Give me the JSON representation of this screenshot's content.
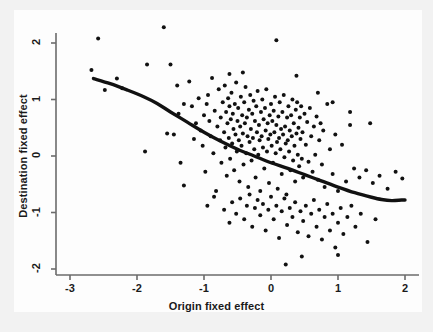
{
  "figure": {
    "background_color": "#f2f2f2",
    "panel_color": "#fdfdfd",
    "axis_color": "#6b6b6b",
    "point_color": "#111111",
    "curve_color": "#111111"
  },
  "chart_data": {
    "type": "scatter",
    "title": "",
    "xlabel": "Origin fixed effect",
    "ylabel": "Destination fixed effect",
    "xlim": [
      -3.05,
      2.1
    ],
    "ylim": [
      -2.15,
      2.35
    ],
    "xticks": [
      -3,
      -2,
      -1,
      0,
      1,
      2
    ],
    "xticklabels": [
      "-3",
      "-2",
      "-1",
      "0",
      "1",
      "2"
    ],
    "yticks": [
      -2,
      -1,
      0,
      1,
      2
    ],
    "yticklabels": [
      "-2",
      "-1",
      "0",
      "1",
      "2"
    ],
    "grid": false,
    "legend": false,
    "marker": "filled-circle",
    "marker_size": 2.0,
    "points": [
      [
        -2.68,
        1.52
      ],
      [
        -2.58,
        2.08
      ],
      [
        -2.48,
        1.17
      ],
      [
        -2.3,
        1.37
      ],
      [
        -2.22,
        1.2
      ],
      [
        -1.88,
        0.08
      ],
      [
        -1.85,
        1.62
      ],
      [
        -1.6,
        2.28
      ],
      [
        -1.55,
        0.4
      ],
      [
        -1.5,
        1.62
      ],
      [
        -1.4,
        1.25
      ],
      [
        -1.38,
        0.75
      ],
      [
        -1.35,
        -0.12
      ],
      [
        -1.3,
        -0.52
      ],
      [
        -1.22,
        1.32
      ],
      [
        -1.18,
        0.88
      ],
      [
        -1.15,
        0.3
      ],
      [
        -1.12,
        0.58
      ],
      [
        -1.08,
        1.02
      ],
      [
        -1.05,
        0.45
      ],
      [
        -1.02,
        0.18
      ],
      [
        -1.0,
        0.72
      ],
      [
        -0.98,
        -0.28
      ],
      [
        -0.96,
        0.92
      ],
      [
        -0.94,
        1.08
      ],
      [
        -0.92,
        0.62
      ],
      [
        -0.9,
        0.35
      ],
      [
        -0.88,
        1.38
      ],
      [
        -0.86,
        0.05
      ],
      [
        -0.84,
        0.8
      ],
      [
        -0.82,
        -0.62
      ],
      [
        -0.8,
        0.52
      ],
      [
        -0.78,
        1.18
      ],
      [
        -0.76,
        0.28
      ],
      [
        -0.75,
        0.68
      ],
      [
        -0.74,
        -0.12
      ],
      [
        -0.72,
        0.95
      ],
      [
        -0.7,
        0.42
      ],
      [
        -0.69,
        1.25
      ],
      [
        -0.68,
        0.15
      ],
      [
        -0.67,
        0.78
      ],
      [
        -0.66,
        -0.35
      ],
      [
        -0.65,
        0.58
      ],
      [
        -0.64,
        1.02
      ],
      [
        -0.63,
        0.32
      ],
      [
        -0.62,
        0.88
      ],
      [
        -0.61,
        -0.05
      ],
      [
        -0.6,
        0.65
      ],
      [
        -0.59,
        1.12
      ],
      [
        -0.58,
        0.22
      ],
      [
        -0.57,
        0.75
      ],
      [
        -0.56,
        0.48
      ],
      [
        -0.55,
        -0.25
      ],
      [
        -0.54,
        0.92
      ],
      [
        -0.53,
        0.38
      ],
      [
        -0.52,
        1.3
      ],
      [
        -0.51,
        0.08
      ],
      [
        -0.5,
        0.62
      ],
      [
        -0.49,
        0.85
      ],
      [
        -0.48,
        0.28
      ],
      [
        -0.47,
        -0.45
      ],
      [
        -0.46,
        0.52
      ],
      [
        -0.45,
        1.05
      ],
      [
        -0.44,
        0.18
      ],
      [
        -0.43,
        0.72
      ],
      [
        -0.42,
        0.4
      ],
      [
        -0.41,
        -0.15
      ],
      [
        -0.4,
        0.95
      ],
      [
        -0.39,
        0.58
      ],
      [
        -0.38,
        1.22
      ],
      [
        -0.37,
        0.05
      ],
      [
        -0.36,
        0.68
      ],
      [
        -0.35,
        0.35
      ],
      [
        -0.34,
        -0.55
      ],
      [
        -0.33,
        0.82
      ],
      [
        -0.32,
        0.25
      ],
      [
        -0.31,
        1.08
      ],
      [
        -0.3,
        0.48
      ],
      [
        -0.29,
        -0.08
      ],
      [
        -0.28,
        0.75
      ],
      [
        -0.27,
        0.32
      ],
      [
        -0.26,
        0.98
      ],
      [
        -0.25,
        0.12
      ],
      [
        -0.24,
        0.62
      ],
      [
        -0.23,
        -0.38
      ],
      [
        -0.22,
        0.88
      ],
      [
        -0.21,
        0.42
      ],
      [
        -0.2,
        1.15
      ],
      [
        -0.19,
        0.02
      ],
      [
        -0.18,
        0.55
      ],
      [
        -0.17,
        0.28
      ],
      [
        -0.16,
        -0.62
      ],
      [
        -0.15,
        0.78
      ],
      [
        -0.14,
        0.35
      ],
      [
        -0.13,
        1.0
      ],
      [
        -0.12,
        0.15
      ],
      [
        -0.11,
        0.65
      ],
      [
        -0.1,
        -0.22
      ],
      [
        -0.09,
        0.85
      ],
      [
        -0.08,
        0.45
      ],
      [
        -0.07,
        1.18
      ],
      [
        -0.06,
        0.08
      ],
      [
        -0.05,
        0.58
      ],
      [
        -0.04,
        0.3
      ],
      [
        -0.03,
        -0.48
      ],
      [
        -0.02,
        0.72
      ],
      [
        -0.01,
        0.38
      ],
      [
        0.0,
        0.92
      ],
      [
        0.01,
        0.18
      ],
      [
        0.02,
        0.62
      ],
      [
        0.03,
        -0.12
      ],
      [
        0.04,
        0.8
      ],
      [
        0.05,
        0.42
      ],
      [
        0.06,
        1.05
      ],
      [
        0.07,
        0.05
      ],
      [
        0.08,
        0.55
      ],
      [
        0.09,
        0.25
      ],
      [
        0.1,
        -0.58
      ],
      [
        0.11,
        0.7
      ],
      [
        0.12,
        0.32
      ],
      [
        0.13,
        0.95
      ],
      [
        0.14,
        0.12
      ],
      [
        0.15,
        0.48
      ],
      [
        0.16,
        -0.32
      ],
      [
        0.17,
        0.78
      ],
      [
        0.18,
        0.38
      ],
      [
        0.19,
        1.08
      ],
      [
        0.2,
        -0.02
      ],
      [
        0.21,
        0.52
      ],
      [
        0.22,
        0.22
      ],
      [
        0.23,
        -0.68
      ],
      [
        0.24,
        0.68
      ],
      [
        0.25,
        0.28
      ],
      [
        0.26,
        0.88
      ],
      [
        0.27,
        0.08
      ],
      [
        0.28,
        0.45
      ],
      [
        0.29,
        -0.25
      ],
      [
        0.3,
        0.72
      ],
      [
        0.31,
        0.35
      ],
      [
        0.32,
        1.0
      ],
      [
        0.33,
        -0.08
      ],
      [
        0.34,
        0.58
      ],
      [
        0.35,
        0.18
      ],
      [
        0.36,
        -0.45
      ],
      [
        0.37,
        0.82
      ],
      [
        0.38,
        0.4
      ],
      [
        0.39,
        0.95
      ],
      [
        0.4,
        0.02
      ],
      [
        0.41,
        0.5
      ],
      [
        0.42,
        -0.18
      ],
      [
        0.43,
        0.68
      ],
      [
        0.44,
        0.3
      ],
      [
        0.45,
        0.88
      ],
      [
        0.46,
        -0.05
      ],
      [
        0.47,
        0.42
      ],
      [
        0.48,
        -0.38
      ],
      [
        0.5,
        0.75
      ],
      [
        0.52,
        0.2
      ],
      [
        0.54,
        0.6
      ],
      [
        0.56,
        -0.1
      ],
      [
        0.58,
        0.85
      ],
      [
        0.6,
        0.35
      ],
      [
        0.62,
        -0.28
      ],
      [
        0.64,
        0.52
      ],
      [
        0.66,
        0.02
      ],
      [
        0.68,
        0.7
      ],
      [
        0.7,
        -0.42
      ],
      [
        0.72,
        0.28
      ],
      [
        0.74,
        0.58
      ],
      [
        0.76,
        -0.15
      ],
      [
        0.78,
        0.45
      ],
      [
        0.8,
        -0.55
      ],
      [
        0.84,
        0.92
      ],
      [
        0.88,
        0.12
      ],
      [
        0.92,
        -0.32
      ],
      [
        0.96,
        0.38
      ],
      [
        1.0,
        -0.62
      ],
      [
        1.06,
        0.2
      ],
      [
        1.12,
        -0.45
      ],
      [
        1.18,
        0.55
      ],
      [
        1.24,
        -0.22
      ],
      [
        1.32,
        -0.38
      ],
      [
        1.42,
        -0.25
      ],
      [
        1.52,
        -0.48
      ],
      [
        1.62,
        -0.35
      ],
      [
        1.74,
        -0.58
      ],
      [
        1.86,
        -0.28
      ],
      [
        1.96,
        -0.4
      ],
      [
        -0.95,
        -0.88
      ],
      [
        -0.85,
        -0.72
      ],
      [
        -0.7,
        -0.95
      ],
      [
        -0.62,
        -1.18
      ],
      [
        -0.58,
        -0.82
      ],
      [
        -0.52,
        -1.02
      ],
      [
        -0.46,
        -0.75
      ],
      [
        -0.4,
        -1.12
      ],
      [
        -0.36,
        -0.88
      ],
      [
        -0.32,
        -0.68
      ],
      [
        -0.28,
        -1.25
      ],
      [
        -0.24,
        -0.92
      ],
      [
        -0.2,
        -0.78
      ],
      [
        -0.16,
        -1.05
      ],
      [
        -0.12,
        -0.85
      ],
      [
        -0.08,
        -1.32
      ],
      [
        -0.04,
        -0.95
      ],
      [
        0.0,
        -0.72
      ],
      [
        0.04,
        -1.12
      ],
      [
        0.08,
        -0.88
      ],
      [
        0.12,
        -1.45
      ],
      [
        0.16,
        -0.98
      ],
      [
        0.2,
        -0.75
      ],
      [
        0.24,
        -1.22
      ],
      [
        0.28,
        -0.92
      ],
      [
        0.32,
        -1.08
      ],
      [
        0.36,
        -0.82
      ],
      [
        0.4,
        -1.35
      ],
      [
        0.44,
        -0.98
      ],
      [
        0.48,
        -1.15
      ],
      [
        0.52,
        -0.88
      ],
      [
        0.56,
        -1.42
      ],
      [
        0.6,
        -1.02
      ],
      [
        0.64,
        -0.78
      ],
      [
        0.68,
        -1.25
      ],
      [
        0.72,
        -0.95
      ],
      [
        0.76,
        -1.48
      ],
      [
        0.8,
        -1.08
      ],
      [
        0.84,
        -0.85
      ],
      [
        0.88,
        -1.32
      ],
      [
        0.92,
        -1.02
      ],
      [
        0.96,
        -1.62
      ],
      [
        1.0,
        -1.18
      ],
      [
        1.04,
        -0.92
      ],
      [
        1.08,
        -1.38
      ],
      [
        1.14,
        -1.08
      ],
      [
        1.2,
        -0.88
      ],
      [
        1.26,
        -1.25
      ],
      [
        1.34,
        -1.02
      ],
      [
        1.44,
        -1.52
      ],
      [
        1.56,
        -1.12
      ],
      [
        0.22,
        -1.92
      ],
      [
        0.46,
        -1.78
      ],
      [
        1.0,
        -1.75
      ],
      [
        -0.62,
        1.45
      ],
      [
        -0.42,
        1.48
      ],
      [
        0.08,
        2.05
      ],
      [
        0.38,
        1.42
      ],
      [
        0.7,
        1.12
      ],
      [
        0.92,
        0.95
      ],
      [
        1.18,
        0.78
      ],
      [
        1.48,
        0.58
      ],
      [
        -1.45,
        0.38
      ],
      [
        -1.3,
        0.92
      ]
    ],
    "fit_curve": {
      "label": "lowess smoother",
      "x": [
        -2.65,
        -2.4,
        -2.15,
        -1.9,
        -1.7,
        -1.5,
        -1.25,
        -1.0,
        -0.75,
        -0.5,
        -0.25,
        0.0,
        0.25,
        0.5,
        0.75,
        1.0,
        1.25,
        1.5,
        1.65,
        1.8,
        1.95,
        2.0
      ],
      "y": [
        1.37,
        1.28,
        1.17,
        1.05,
        0.93,
        0.78,
        0.6,
        0.42,
        0.26,
        0.12,
        0.0,
        -0.12,
        -0.22,
        -0.33,
        -0.44,
        -0.55,
        -0.65,
        -0.73,
        -0.77,
        -0.79,
        -0.78,
        -0.78
      ]
    }
  }
}
